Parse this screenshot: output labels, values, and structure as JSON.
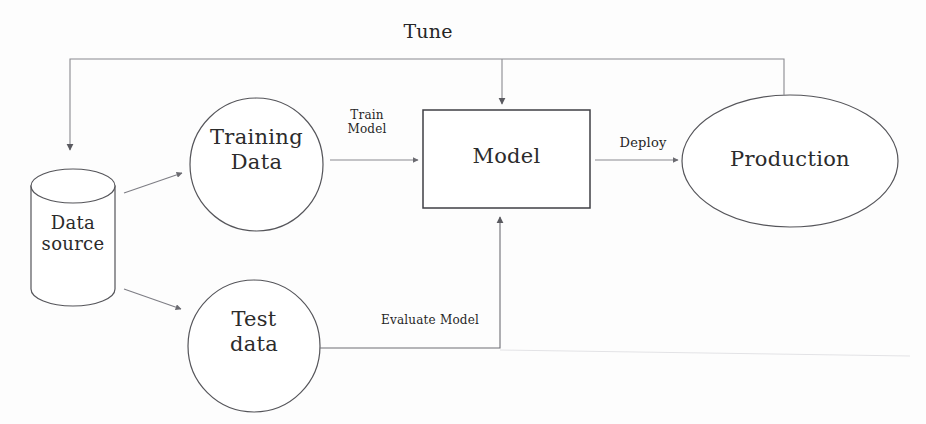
{
  "diagram": {
    "background_color": "#fdfdfd",
    "stroke_color": "#55555a",
    "text_color": "#2b2b2b",
    "nodes": [
      {
        "id": "data-source",
        "shape": "cylinder",
        "label": "Data\nsource"
      },
      {
        "id": "training-data",
        "shape": "circle",
        "label": "Training\nData"
      },
      {
        "id": "test-data",
        "shape": "circle",
        "label": "Test\ndata"
      },
      {
        "id": "model",
        "shape": "rectangle",
        "label": "Model"
      },
      {
        "id": "production",
        "shape": "ellipse",
        "label": "Production"
      }
    ],
    "edges": [
      {
        "id": "split-training",
        "from": "data-source",
        "to": "training-data",
        "label": ""
      },
      {
        "id": "split-test",
        "from": "data-source",
        "to": "test-data",
        "label": ""
      },
      {
        "id": "train-model",
        "from": "training-data",
        "to": "model",
        "label": "Train\nModel"
      },
      {
        "id": "deploy",
        "from": "model",
        "to": "production",
        "label": "Deploy"
      },
      {
        "id": "tune",
        "from": "production",
        "to": "data-source",
        "label": "Tune"
      },
      {
        "id": "evaluate-model",
        "from": "test-data",
        "to": "model",
        "label": "Evaluate Model"
      }
    ]
  }
}
